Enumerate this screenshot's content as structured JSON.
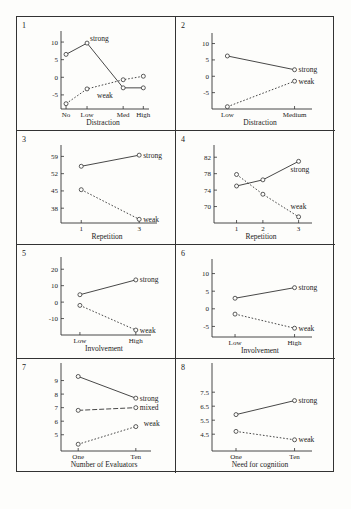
{
  "chart_data": [
    {
      "type": "line",
      "panel_number": "1",
      "xlabel": "Distraction",
      "categories": [
        "No",
        "Low",
        "Med",
        "High"
      ],
      "ylim": [
        -9,
        12
      ],
      "yticks": [
        10,
        5,
        0,
        -5
      ],
      "ytick_labels": [
        "10",
        "5",
        "0",
        "-5"
      ],
      "series": [
        {
          "name": "strong",
          "style": "solid",
          "values": [
            6.5,
            9.7,
            -3,
            -3
          ]
        },
        {
          "name": "weak",
          "style": "dotted",
          "values": [
            -7.5,
            -3.3,
            -0.7,
            0.3
          ]
        }
      ]
    },
    {
      "type": "line",
      "panel_number": "2",
      "xlabel": "Distraction",
      "categories": [
        "Low",
        "Medium"
      ],
      "ylim": [
        -10,
        12
      ],
      "yticks": [
        10,
        5,
        0,
        -5
      ],
      "ytick_labels": [
        "10",
        "5",
        "0",
        "-5"
      ],
      "series": [
        {
          "name": "strong",
          "style": "solid",
          "values": [
            6.2,
            2.0
          ]
        },
        {
          "name": "weak",
          "style": "dotted",
          "values": [
            -9.3,
            -1.5
          ]
        }
      ]
    },
    {
      "type": "line",
      "panel_number": "3",
      "xlabel": "Repetition",
      "categories": [
        "1",
        "3"
      ],
      "ylim": [
        32,
        62
      ],
      "yticks": [
        59,
        52,
        45,
        38
      ],
      "ytick_labels": [
        "59",
        "52",
        "45",
        "38"
      ],
      "series": [
        {
          "name": "strong",
          "style": "solid",
          "values": [
            55,
            59.5
          ]
        },
        {
          "name": "weak",
          "style": "dotted",
          "values": [
            45.5,
            33.5
          ]
        }
      ]
    },
    {
      "type": "line",
      "panel_number": "4",
      "xlabel": "Repetition",
      "categories": [
        "1",
        "2",
        "3"
      ],
      "ylim": [
        66,
        84
      ],
      "yticks": [
        82,
        78,
        74,
        70
      ],
      "ytick_labels": [
        "82",
        "78",
        "74",
        "70"
      ],
      "series": [
        {
          "name": "strong",
          "style": "solid",
          "values": [
            75,
            76.5,
            81
          ]
        },
        {
          "name": "weak",
          "style": "dotted",
          "values": [
            77.8,
            73,
            67.5
          ]
        }
      ]
    },
    {
      "type": "line",
      "panel_number": "5",
      "xlabel": "Involvement",
      "categories": [
        "Low",
        "High"
      ],
      "ylim": [
        -20,
        25
      ],
      "yticks": [
        20,
        10,
        0,
        -10
      ],
      "ytick_labels": [
        "20",
        "10",
        "0",
        "-10"
      ],
      "series": [
        {
          "name": "strong",
          "style": "solid",
          "values": [
            4.5,
            13.5
          ]
        },
        {
          "name": "weak",
          "style": "dotted",
          "values": [
            -2,
            -17
          ]
        }
      ]
    },
    {
      "type": "line",
      "panel_number": "6",
      "xlabel": "Involvement",
      "categories": [
        "Low",
        "High"
      ],
      "ylim": [
        -8,
        13
      ],
      "yticks": [
        10,
        5,
        0,
        -5
      ],
      "ytick_labels": [
        "10",
        "5",
        "0",
        "-5"
      ],
      "series": [
        {
          "name": "strong",
          "style": "solid",
          "values": [
            3,
            6
          ]
        },
        {
          "name": "weak",
          "style": "dotted",
          "values": [
            -1.5,
            -5.5
          ]
        }
      ]
    },
    {
      "type": "line",
      "panel_number": "7",
      "xlabel": "Number of Evaluators",
      "categories": [
        "One",
        "Ten"
      ],
      "ylim": [
        3.8,
        10
      ],
      "yticks": [
        9,
        8,
        7,
        6,
        5
      ],
      "ytick_labels": [
        "9",
        "8",
        "7",
        "6",
        "5"
      ],
      "series": [
        {
          "name": "strong",
          "style": "solid",
          "values": [
            9.3,
            7.7
          ]
        },
        {
          "name": "mixed",
          "style": "dashed",
          "values": [
            6.8,
            7.0
          ]
        },
        {
          "name": "weak",
          "style": "dotted",
          "values": [
            4.3,
            5.6
          ]
        }
      ]
    },
    {
      "type": "line",
      "panel_number": "8",
      "xlabel": "Need for cognition",
      "categories": [
        "One",
        "Ten"
      ],
      "ylim": [
        3.3,
        9.3
      ],
      "yticks": [
        7.5,
        6.5,
        5.5,
        4.5
      ],
      "ytick_labels": [
        "7.5",
        "6.5",
        "5.5",
        "4.5"
      ],
      "series": [
        {
          "name": "strong",
          "style": "solid",
          "values": [
            5.9,
            6.9
          ]
        },
        {
          "name": "weak",
          "style": "dotted",
          "values": [
            4.7,
            4.1
          ]
        }
      ]
    }
  ]
}
